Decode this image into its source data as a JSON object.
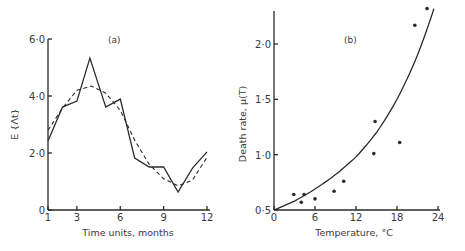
{
  "chart_data": [
    {
      "type": "line",
      "panel_label": "(a)",
      "title": "",
      "xlabel": "Time units, months",
      "ylabel": "E {Λt}",
      "xlim": [
        1,
        12
      ],
      "ylim": [
        0,
        6.0
      ],
      "x_ticks": [
        1,
        3,
        6,
        9,
        12
      ],
      "x_tick_labels": [
        "1",
        "3",
        "6",
        "9",
        "12"
      ],
      "y_ticks": [
        0,
        2.0,
        4.0,
        6.0
      ],
      "y_tick_labels": [
        "0",
        "2·0",
        "4·0",
        "6·0"
      ],
      "grid": false,
      "legend": null,
      "x": [
        1,
        2,
        3,
        4,
        5,
        6,
        7,
        8,
        9,
        10,
        11,
        12
      ],
      "series": [
        {
          "name": "observed",
          "style": "solid",
          "x": [
            1,
            2,
            3,
            3.9,
            5,
            6,
            7,
            8,
            9,
            10,
            11,
            12
          ],
          "values": [
            2.42,
            3.61,
            3.82,
            5.33,
            3.61,
            3.89,
            1.82,
            1.51,
            1.51,
            0.63,
            1.47,
            2.04
          ]
        },
        {
          "name": "fitted",
          "style": "dashed",
          "x": [
            1,
            2,
            3,
            4,
            5,
            6,
            7,
            8,
            9,
            10,
            11,
            12
          ],
          "values": [
            2.8,
            3.58,
            4.2,
            4.35,
            4.1,
            3.5,
            2.45,
            1.6,
            1.1,
            0.85,
            1.05,
            1.85
          ]
        }
      ]
    },
    {
      "type": "scatter",
      "panel_label": "(b)",
      "title": "",
      "xlabel": "Temperature, °C",
      "ylabel": "Death rate, μ(T)",
      "xlim": [
        0,
        24
      ],
      "ylim": [
        0.5,
        2.35
      ],
      "x_ticks": [
        0,
        6,
        12,
        18,
        24
      ],
      "x_tick_labels": [
        "0",
        "6",
        "12",
        "18",
        "24"
      ],
      "y_ticks": [
        0.5,
        1.0,
        1.5,
        2.0
      ],
      "y_tick_labels": [
        "0·5",
        "1·0",
        "1·5",
        "2·0"
      ],
      "grid": false,
      "legend": null,
      "series": [
        {
          "name": "observed",
          "style": "points",
          "x": [
            2.9,
            4.0,
            4.4,
            6.0,
            8.8,
            10.2,
            14.6,
            14.8,
            18.4,
            20.6,
            22.4
          ],
          "values": [
            0.64,
            0.57,
            0.64,
            0.6,
            0.67,
            0.76,
            1.01,
            1.3,
            1.11,
            2.17,
            2.32
          ]
        },
        {
          "name": "fitted curve",
          "style": "solid",
          "x": [
            0,
            3,
            6,
            9,
            12,
            15,
            18,
            21,
            23.4
          ],
          "values": [
            0.5,
            0.58,
            0.69,
            0.82,
            0.98,
            1.2,
            1.5,
            1.9,
            2.32
          ]
        }
      ]
    }
  ]
}
